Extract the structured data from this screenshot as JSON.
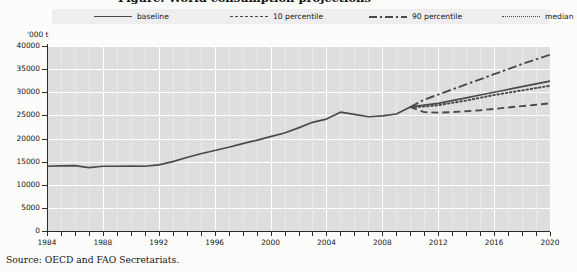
{
  "title": {
    "text": "Figure: World consumption projections"
  },
  "legend": {
    "items": [
      {
        "label": "baseline",
        "style": "solid"
      },
      {
        "label": "10 percentile",
        "style": "dashed"
      },
      {
        "label": "90 percentile",
        "style": "dashdot"
      },
      {
        "label": "median",
        "style": "dotted"
      }
    ]
  },
  "source": {
    "text": "Source:  OECD and FAO Secretariats."
  },
  "colors": {
    "line": "#4a4a4a",
    "plot_background": "#dedede",
    "gridline": "#ffffff",
    "axis": "#2b2b2b",
    "legend_background": "#eeeeee"
  },
  "chart_data": {
    "type": "line",
    "title": "",
    "xlabel": "",
    "ylabel": "'000 t",
    "unit": "'000 t",
    "xlim": [
      1984,
      2020
    ],
    "ylim": [
      0,
      40000
    ],
    "ytick_step": 5000,
    "xtick_step": 1,
    "grid": true,
    "legend_position": "top",
    "ytick_labels": [
      "0",
      "5000",
      "10000",
      "15000",
      "20000",
      "25000",
      "30000",
      "35000",
      "40000"
    ],
    "yticks": [
      0,
      5000,
      10000,
      15000,
      20000,
      25000,
      30000,
      35000,
      40000
    ],
    "xtick_labels": [
      "1984",
      "1988",
      "1992",
      "1996",
      "2000",
      "2004",
      "2008",
      "2012",
      "2016",
      "2020"
    ],
    "xticks": [
      1984,
      1988,
      1992,
      1996,
      2000,
      2004,
      2008,
      2012,
      2016,
      2020
    ],
    "projection_start": 2010,
    "x": [
      1984,
      1985,
      1986,
      1987,
      1988,
      1989,
      1990,
      1991,
      1992,
      1993,
      1994,
      1995,
      1996,
      1997,
      1998,
      1999,
      2000,
      2001,
      2002,
      2003,
      2004,
      2005,
      2006,
      2007,
      2008,
      2009,
      2010,
      2011,
      2012,
      2013,
      2014,
      2015,
      2016,
      2017,
      2018,
      2019,
      2020
    ],
    "series": [
      {
        "name": "baseline",
        "style": "solid",
        "values": [
          14000,
          14100,
          14150,
          13700,
          14000,
          14000,
          14050,
          14000,
          14300,
          15000,
          15900,
          16700,
          17400,
          18100,
          18900,
          19600,
          20400,
          21200,
          22300,
          23500,
          24200,
          25700,
          25200,
          24700,
          24900,
          25300,
          26800,
          27200,
          27600,
          28200,
          28800,
          29400,
          30000,
          30600,
          31200,
          31800,
          32400
        ]
      },
      {
        "name": "10 percentile",
        "style": "dashed",
        "values": [
          null,
          null,
          null,
          null,
          null,
          null,
          null,
          null,
          null,
          null,
          null,
          null,
          null,
          null,
          null,
          null,
          null,
          null,
          null,
          null,
          null,
          null,
          null,
          null,
          null,
          null,
          26800,
          25700,
          25600,
          25700,
          25900,
          26100,
          26400,
          26700,
          27000,
          27300,
          27600
        ]
      },
      {
        "name": "90 percentile",
        "style": "dashdot",
        "values": [
          null,
          null,
          null,
          null,
          null,
          null,
          null,
          null,
          null,
          null,
          null,
          null,
          null,
          null,
          null,
          null,
          null,
          null,
          null,
          null,
          null,
          null,
          null,
          null,
          null,
          null,
          26800,
          28400,
          29500,
          30600,
          31700,
          32800,
          33900,
          35000,
          36100,
          37100,
          38100
        ]
      },
      {
        "name": "median",
        "style": "dotted",
        "values": [
          null,
          null,
          null,
          null,
          null,
          null,
          null,
          null,
          null,
          null,
          null,
          null,
          null,
          null,
          null,
          null,
          null,
          null,
          null,
          null,
          null,
          null,
          null,
          null,
          null,
          null,
          26800,
          26900,
          27200,
          27700,
          28200,
          28800,
          29400,
          29900,
          30400,
          30900,
          31400
        ]
      }
    ]
  }
}
